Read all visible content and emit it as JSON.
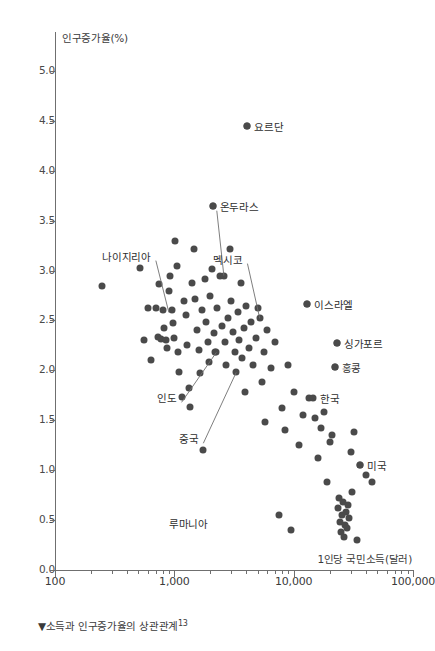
{
  "chart_data": {
    "type": "scatter",
    "title": "",
    "caption": "▼소득과 인구증가율의 상관관계",
    "caption_note": "13",
    "xlabel": "1인당 국민소득(달러)",
    "ylabel": "인구증가율(%)",
    "xscale": "log",
    "xlim": [
      100,
      100000
    ],
    "ylim": [
      0.0,
      5.25
    ],
    "grid": false,
    "legend": "none",
    "point_color": "#4a4a4a",
    "axis_color": "#6f6f6f",
    "xticks": [
      {
        "value": 100,
        "label": "100"
      },
      {
        "value": 1000,
        "label": "1,000"
      },
      {
        "value": 10000,
        "label": "10,000"
      },
      {
        "value": 100000,
        "label": "100,000"
      }
    ],
    "yticks": [
      {
        "value": 0.0,
        "label": "0.0"
      },
      {
        "value": 0.5,
        "label": "0.5"
      },
      {
        "value": 1.0,
        "label": "1.0"
      },
      {
        "value": 1.5,
        "label": "1.5"
      },
      {
        "value": 2.0,
        "label": "2.0"
      },
      {
        "value": 2.5,
        "label": "2.5"
      },
      {
        "value": 3.0,
        "label": "3.0"
      },
      {
        "value": 3.5,
        "label": "3.5"
      },
      {
        "value": 4.0,
        "label": "4.0"
      },
      {
        "value": 4.5,
        "label": "4.5"
      },
      {
        "value": 5.0,
        "label": "5.0"
      }
    ],
    "annotations": [
      {
        "label": "요르단",
        "x": 4100,
        "y": 4.45,
        "dot": true,
        "label_side": "right",
        "leader": false
      },
      {
        "label": "온두라스",
        "x": 2100,
        "y": 3.65,
        "dot": true,
        "label_side": "right",
        "leader": true,
        "leader_to_x": 2600,
        "leader_to_y": 2.95
      },
      {
        "label": "나이지리아",
        "x": 700,
        "y": 3.15,
        "dot": false,
        "label_side": "left",
        "leader": true,
        "leader_to_x": 900,
        "leader_to_y": 2.58
      },
      {
        "label": "멕시코",
        "x": 4100,
        "y": 3.12,
        "dot": false,
        "label_side": "left",
        "leader": true,
        "leader_to_x": 5200,
        "leader_to_y": 2.52
      },
      {
        "label": "이스라엘",
        "x": 13000,
        "y": 2.67,
        "dot": true,
        "label_side": "right",
        "leader": false
      },
      {
        "label": "싱가포르",
        "x": 23000,
        "y": 2.27,
        "dot": true,
        "label_side": "right",
        "leader": false
      },
      {
        "label": "홍콩",
        "x": 22000,
        "y": 2.03,
        "dot": true,
        "label_side": "right",
        "leader": false
      },
      {
        "label": "인도",
        "x": 1150,
        "y": 1.73,
        "dot": false,
        "label_side": "left",
        "leader": true,
        "leader_to_x": 2250,
        "leader_to_y": 2.18
      },
      {
        "label": "중국",
        "x": 1750,
        "y": 1.32,
        "dot": false,
        "label_side": "left",
        "leader": true,
        "leader_to_x": 3300,
        "leader_to_y": 1.98
      },
      {
        "label": "한국",
        "x": 14500,
        "y": 1.72,
        "dot": false,
        "label_side": "right",
        "leader": false
      },
      {
        "label": "미국",
        "x": 36000,
        "y": 1.05,
        "dot": true,
        "label_side": "right",
        "leader": false
      },
      {
        "label": "루마니아",
        "x": 2100,
        "y": 0.47,
        "dot": false,
        "label_side": "left",
        "leader": false
      }
    ],
    "points": [
      {
        "x": 250,
        "y": 2.85
      },
      {
        "x": 520,
        "y": 3.03
      },
      {
        "x": 560,
        "y": 2.3
      },
      {
        "x": 600,
        "y": 2.62
      },
      {
        "x": 640,
        "y": 2.1
      },
      {
        "x": 700,
        "y": 2.62
      },
      {
        "x": 730,
        "y": 2.33
      },
      {
        "x": 750,
        "y": 2.87
      },
      {
        "x": 780,
        "y": 2.31
      },
      {
        "x": 800,
        "y": 2.6
      },
      {
        "x": 820,
        "y": 2.42
      },
      {
        "x": 850,
        "y": 2.3
      },
      {
        "x": 870,
        "y": 2.22
      },
      {
        "x": 900,
        "y": 2.8
      },
      {
        "x": 920,
        "y": 2.95
      },
      {
        "x": 950,
        "y": 2.6
      },
      {
        "x": 980,
        "y": 2.47
      },
      {
        "x": 1000,
        "y": 2.32
      },
      {
        "x": 1020,
        "y": 3.3
      },
      {
        "x": 1050,
        "y": 3.05
      },
      {
        "x": 1080,
        "y": 2.18
      },
      {
        "x": 1100,
        "y": 1.98
      },
      {
        "x": 1150,
        "y": 1.73
      },
      {
        "x": 1200,
        "y": 2.7
      },
      {
        "x": 1250,
        "y": 2.55
      },
      {
        "x": 1280,
        "y": 2.25
      },
      {
        "x": 1320,
        "y": 1.82
      },
      {
        "x": 1350,
        "y": 1.63
      },
      {
        "x": 1400,
        "y": 2.88
      },
      {
        "x": 1450,
        "y": 3.22
      },
      {
        "x": 1500,
        "y": 2.72
      },
      {
        "x": 1550,
        "y": 2.4
      },
      {
        "x": 1600,
        "y": 2.2
      },
      {
        "x": 1650,
        "y": 1.97
      },
      {
        "x": 1700,
        "y": 2.6
      },
      {
        "x": 1750,
        "y": 1.2
      },
      {
        "x": 1800,
        "y": 2.92
      },
      {
        "x": 1850,
        "y": 2.48
      },
      {
        "x": 1900,
        "y": 2.28
      },
      {
        "x": 1950,
        "y": 2.08
      },
      {
        "x": 2000,
        "y": 2.75
      },
      {
        "x": 2050,
        "y": 3.02
      },
      {
        "x": 2100,
        "y": 3.65
      },
      {
        "x": 2150,
        "y": 2.37
      },
      {
        "x": 2200,
        "y": 2.18
      },
      {
        "x": 2250,
        "y": 2.18
      },
      {
        "x": 2300,
        "y": 2.62
      },
      {
        "x": 2400,
        "y": 2.95
      },
      {
        "x": 2500,
        "y": 2.44
      },
      {
        "x": 2600,
        "y": 2.95
      },
      {
        "x": 2650,
        "y": 2.28
      },
      {
        "x": 2700,
        "y": 2.05
      },
      {
        "x": 2800,
        "y": 2.52
      },
      {
        "x": 2900,
        "y": 3.22
      },
      {
        "x": 3000,
        "y": 2.7
      },
      {
        "x": 3100,
        "y": 2.38
      },
      {
        "x": 3200,
        "y": 2.18
      },
      {
        "x": 3300,
        "y": 1.98
      },
      {
        "x": 3400,
        "y": 2.58
      },
      {
        "x": 3500,
        "y": 2.3
      },
      {
        "x": 3600,
        "y": 2.88
      },
      {
        "x": 3700,
        "y": 2.12
      },
      {
        "x": 3800,
        "y": 2.42
      },
      {
        "x": 3900,
        "y": 1.78
      },
      {
        "x": 4000,
        "y": 2.65
      },
      {
        "x": 4100,
        "y": 4.45
      },
      {
        "x": 4200,
        "y": 2.22
      },
      {
        "x": 4400,
        "y": 2.48
      },
      {
        "x": 4600,
        "y": 2.05
      },
      {
        "x": 4800,
        "y": 2.32
      },
      {
        "x": 5000,
        "y": 2.62
      },
      {
        "x": 5200,
        "y": 2.52
      },
      {
        "x": 5400,
        "y": 1.88
      },
      {
        "x": 5600,
        "y": 2.18
      },
      {
        "x": 5800,
        "y": 1.48
      },
      {
        "x": 6000,
        "y": 2.4
      },
      {
        "x": 6500,
        "y": 2.02
      },
      {
        "x": 7000,
        "y": 2.28
      },
      {
        "x": 7500,
        "y": 0.55
      },
      {
        "x": 8000,
        "y": 1.62
      },
      {
        "x": 8500,
        "y": 1.4
      },
      {
        "x": 9000,
        "y": 2.05
      },
      {
        "x": 9500,
        "y": 0.4
      },
      {
        "x": 10000,
        "y": 1.78
      },
      {
        "x": 11000,
        "y": 1.25
      },
      {
        "x": 12000,
        "y": 1.55
      },
      {
        "x": 13000,
        "y": 2.67
      },
      {
        "x": 13500,
        "y": 1.72
      },
      {
        "x": 14500,
        "y": 1.72
      },
      {
        "x": 15000,
        "y": 1.52
      },
      {
        "x": 16000,
        "y": 1.12
      },
      {
        "x": 17000,
        "y": 1.42
      },
      {
        "x": 18000,
        "y": 1.58
      },
      {
        "x": 19000,
        "y": 0.88
      },
      {
        "x": 20000,
        "y": 1.28
      },
      {
        "x": 21000,
        "y": 1.35
      },
      {
        "x": 22000,
        "y": 2.03
      },
      {
        "x": 23000,
        "y": 2.27
      },
      {
        "x": 23500,
        "y": 0.62
      },
      {
        "x": 24000,
        "y": 0.72
      },
      {
        "x": 24500,
        "y": 0.48
      },
      {
        "x": 25000,
        "y": 0.38
      },
      {
        "x": 25500,
        "y": 0.55
      },
      {
        "x": 26000,
        "y": 0.68
      },
      {
        "x": 26500,
        "y": 0.33
      },
      {
        "x": 27000,
        "y": 0.45
      },
      {
        "x": 27500,
        "y": 0.58
      },
      {
        "x": 28000,
        "y": 0.42
      },
      {
        "x": 28500,
        "y": 0.65
      },
      {
        "x": 29000,
        "y": 0.52
      },
      {
        "x": 30000,
        "y": 1.18
      },
      {
        "x": 31000,
        "y": 0.78
      },
      {
        "x": 32000,
        "y": 1.38
      },
      {
        "x": 34000,
        "y": 0.3
      },
      {
        "x": 36000,
        "y": 1.05
      },
      {
        "x": 40000,
        "y": 0.95
      },
      {
        "x": 45000,
        "y": 0.88
      }
    ]
  }
}
